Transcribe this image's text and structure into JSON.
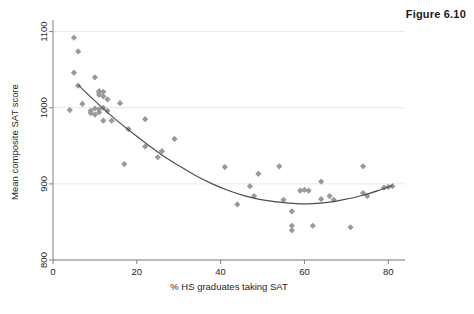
{
  "figure": {
    "caption": "Figure 6.10"
  },
  "colors": {
    "marker": "#999999",
    "curve": "#4d4d4d",
    "axis": "#808080",
    "gridline": "#e8e8e8",
    "text": "#1f1f1f",
    "background": "#ffffff"
  },
  "chart_data": {
    "type": "scatter",
    "title": "",
    "subtitle": "",
    "xlabel": "% HS graduates taking SAT",
    "ylabel": "Mean composite SAT score",
    "xlim": [
      0,
      84
    ],
    "ylim": [
      800,
      1110
    ],
    "xticks": [
      0,
      20,
      40,
      60,
      80
    ],
    "xtick_labels": [
      "0",
      "20",
      "40",
      "60",
      "80"
    ],
    "yticks": [
      800,
      900,
      1000,
      1100
    ],
    "ytick_labels": [
      "800",
      "900",
      "1000",
      "1100"
    ],
    "grid": "horizontal",
    "legend": "none",
    "marker_shape": "diamond",
    "series": [
      {
        "name": "States",
        "type": "scatter",
        "points": [
          [
            5,
            1092
          ],
          [
            4,
            997
          ],
          [
            6,
            1074
          ],
          [
            5,
            1046
          ],
          [
            6,
            1029
          ],
          [
            7,
            1005
          ],
          [
            9,
            996
          ],
          [
            9,
            993
          ],
          [
            10,
            1040
          ],
          [
            10,
            999
          ],
          [
            10,
            991
          ],
          [
            11,
            1022
          ],
          [
            11,
            1020
          ],
          [
            11,
            1017
          ],
          [
            11,
            998
          ],
          [
            11,
            994
          ],
          [
            12,
            1021
          ],
          [
            12,
            1015
          ],
          [
            12,
            1000
          ],
          [
            12,
            983
          ],
          [
            13,
            1011
          ],
          [
            13,
            996
          ],
          [
            14,
            983
          ],
          [
            16,
            1006
          ],
          [
            17,
            926
          ],
          [
            18,
            972
          ],
          [
            22,
            985
          ],
          [
            22,
            949
          ],
          [
            25,
            935
          ],
          [
            26,
            943
          ],
          [
            29,
            959
          ],
          [
            41,
            922
          ],
          [
            44,
            873
          ],
          [
            47,
            897
          ],
          [
            48,
            884
          ],
          [
            49,
            913
          ],
          [
            54,
            923
          ],
          [
            55,
            879
          ],
          [
            57,
            864
          ],
          [
            57,
            845
          ],
          [
            57,
            839
          ],
          [
            59,
            891
          ],
          [
            60,
            892
          ],
          [
            61,
            891
          ],
          [
            62,
            845
          ],
          [
            64,
            903
          ],
          [
            64,
            880
          ],
          [
            66,
            884
          ],
          [
            67,
            879
          ],
          [
            71,
            843
          ],
          [
            74,
            923
          ],
          [
            74,
            888
          ],
          [
            75,
            884
          ],
          [
            79,
            895
          ],
          [
            80,
            896
          ],
          [
            81,
            897
          ]
        ]
      }
    ],
    "fit_curve": {
      "name": "Quadratic fit",
      "type": "line",
      "points": [
        [
          6,
          1030
        ],
        [
          10,
          1009
        ],
        [
          14,
          989
        ],
        [
          18,
          971
        ],
        [
          22,
          954
        ],
        [
          26,
          938
        ],
        [
          30,
          924
        ],
        [
          34,
          911
        ],
        [
          38,
          900
        ],
        [
          42,
          891
        ],
        [
          46,
          884
        ],
        [
          50,
          879
        ],
        [
          54,
          876
        ],
        [
          58,
          874
        ],
        [
          62,
          874
        ],
        [
          66,
          876
        ],
        [
          70,
          880
        ],
        [
          74,
          885
        ],
        [
          78,
          892
        ],
        [
          81,
          898
        ]
      ]
    }
  }
}
